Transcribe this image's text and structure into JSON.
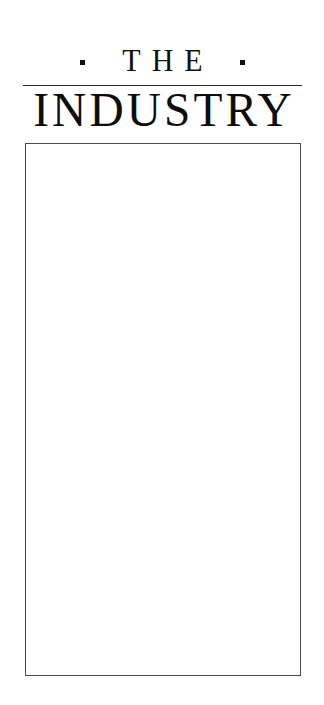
{
  "page": {
    "background_color": "#ffffff",
    "ink_color": "#111111",
    "width": 324,
    "height": 705
  },
  "masthead": {
    "kicker": {
      "text": "THE",
      "left_ornament": "square-bullet",
      "right_ornament": "square-bullet",
      "ornament_color": "#111111"
    },
    "rule": {
      "present": true,
      "color": "#2b2b2b"
    },
    "title": {
      "text": "INDUSTRY",
      "color": "#0e0d0c"
    }
  },
  "content": {
    "frame": {
      "border_color": "#4a4a4a",
      "fill_color": "#ffffff"
    },
    "body_text": ""
  }
}
